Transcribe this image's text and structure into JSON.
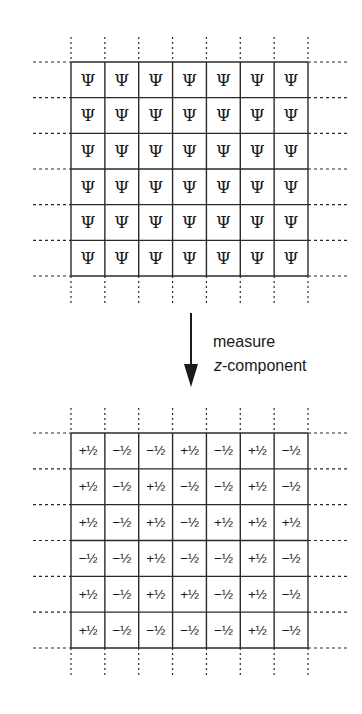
{
  "top_grid": {
    "title": "wavefunction lattice",
    "rows": 6,
    "cols": 7,
    "symbol": "Ψ",
    "cells": [
      [
        "Ψ",
        "Ψ",
        "Ψ",
        "Ψ",
        "Ψ",
        "Ψ",
        "Ψ"
      ],
      [
        "Ψ",
        "Ψ",
        "Ψ",
        "Ψ",
        "Ψ",
        "Ψ",
        "Ψ"
      ],
      [
        "Ψ",
        "Ψ",
        "Ψ",
        "Ψ",
        "Ψ",
        "Ψ",
        "Ψ"
      ],
      [
        "Ψ",
        "Ψ",
        "Ψ",
        "Ψ",
        "Ψ",
        "Ψ",
        "Ψ"
      ],
      [
        "Ψ",
        "Ψ",
        "Ψ",
        "Ψ",
        "Ψ",
        "Ψ",
        "Ψ"
      ],
      [
        "Ψ",
        "Ψ",
        "Ψ",
        "Ψ",
        "Ψ",
        "Ψ",
        "Ψ"
      ]
    ]
  },
  "arrow": {
    "label_line1": "measure",
    "label_line2_italic": "z",
    "label_line2_rest": "-component"
  },
  "bottom_grid": {
    "title": "measured spin lattice",
    "rows": 6,
    "cols": 7,
    "cells": [
      [
        "+½",
        "−½",
        "−½",
        "+½",
        "−½",
        "+½",
        "−½"
      ],
      [
        "+½",
        "−½",
        "+½",
        "−½",
        "−½",
        "+½",
        "−½"
      ],
      [
        "+½",
        "−½",
        "+½",
        "−½",
        "+½",
        "+½",
        "+½"
      ],
      [
        "−½",
        "−½",
        "+½",
        "−½",
        "−½",
        "+½",
        "−½"
      ],
      [
        "+½",
        "−½",
        "+½",
        "+½",
        "−½",
        "+½",
        "−½"
      ],
      [
        "+½",
        "−½",
        "−½",
        "−½",
        "−½",
        "+½",
        "−½"
      ]
    ]
  },
  "colors": {
    "line": "#2a2a2a",
    "text": "#1a1a1a",
    "background": "#ffffff"
  }
}
